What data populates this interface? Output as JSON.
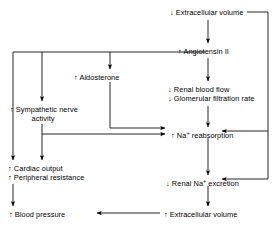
{
  "diagram": {
    "type": "flowchart",
    "background_color": "#ffffff",
    "line_color": "#000000",
    "text_color": "#000000",
    "nodes": [
      {
        "id": "ecv-down",
        "name": "decreased-extracellular-volume",
        "lines": [
          "↓ Extracellular volume"
        ],
        "x": 170,
        "y": 8
      },
      {
        "id": "angiotensin",
        "name": "increased-angiotensin-ii",
        "lines": [
          "↑ Angiotensin II"
        ],
        "x": 178,
        "y": 47
      },
      {
        "id": "aldosterone",
        "name": "increased-aldosterone",
        "lines": [
          "↑ Aldosterone"
        ],
        "x": 74,
        "y": 73
      },
      {
        "id": "renal-flow",
        "name": "decreased-renal-blood-flow-and-gfr",
        "lines": [
          "↓ Renal blood flow",
          "↓ Glomerular filtration rate"
        ],
        "x": 168,
        "y": 85
      },
      {
        "id": "sympathetic",
        "name": "increased-sympathetic-nerve-activity",
        "lines": [
          "↑ Sympathetic nerve",
          "activity"
        ],
        "x": 10,
        "y": 105
      },
      {
        "id": "na-reabsorption",
        "name": "increased-na-reabsorption",
        "lines": [
          "↑ Na+ reabsorption"
        ],
        "x": 171,
        "y": 131
      },
      {
        "id": "cardiac",
        "name": "increased-cardiac-output-and-peripheral-resistance",
        "lines": [
          "↑ Cardiac output",
          "↑ Peripheral resistance"
        ],
        "x": 8,
        "y": 164
      },
      {
        "id": "na-excretion",
        "name": "decreased-renal-na-excretion",
        "lines": [
          "↓ Renal Na+ excretion"
        ],
        "x": 166,
        "y": 179
      },
      {
        "id": "bp",
        "name": "increased-blood-pressure",
        "lines": [
          "↑ Blood pressure"
        ],
        "x": 9,
        "y": 210
      },
      {
        "id": "ecv-up",
        "name": "increased-extracellular-volume",
        "lines": [
          "↑ Extracellular volume"
        ],
        "x": 164,
        "y": 210
      }
    ],
    "edges": [
      {
        "from": "ecv-down",
        "to": "angiotensin",
        "name": "edge-ecv-to-angiotensin"
      },
      {
        "from": "angiotensin",
        "to": "aldosterone",
        "name": "edge-angiotensin-to-aldosterone"
      },
      {
        "from": "angiotensin",
        "to": "renal-flow",
        "name": "edge-angiotensin-to-renal-flow"
      },
      {
        "from": "angiotensin",
        "to": "sympathetic",
        "name": "edge-angiotensin-to-sympathetic"
      },
      {
        "from": "angiotensin",
        "to": "cardiac",
        "name": "edge-angiotensin-to-cardiac-bus"
      },
      {
        "from": "aldosterone",
        "to": "na-reabsorption",
        "name": "edge-aldosterone-to-na-reabsorption"
      },
      {
        "from": "renal-flow",
        "to": "na-reabsorption",
        "name": "edge-renal-flow-to-na-reabsorption"
      },
      {
        "from": "sympathetic",
        "to": "na-reabsorption",
        "name": "edge-sympathetic-to-na-reabsorption"
      },
      {
        "from": "sympathetic",
        "to": "cardiac",
        "name": "edge-sympathetic-to-cardiac"
      },
      {
        "from": "na-reabsorption",
        "to": "na-excretion",
        "name": "edge-na-reabsorption-to-na-excretion"
      },
      {
        "from": "na-excretion",
        "to": "ecv-up",
        "name": "edge-na-excretion-to-ecv-up"
      },
      {
        "from": "ecv-up",
        "to": "bp",
        "name": "edge-ecv-up-to-bp"
      },
      {
        "from": "cardiac",
        "to": "bp",
        "name": "edge-cardiac-to-bp"
      },
      {
        "from": "ecv-down",
        "to": "na-reabsorption",
        "name": "edge-right-rail-to-na-reabsorption"
      },
      {
        "from": "ecv-down",
        "to": "na-excretion",
        "name": "edge-right-rail-to-na-excretion"
      }
    ]
  }
}
